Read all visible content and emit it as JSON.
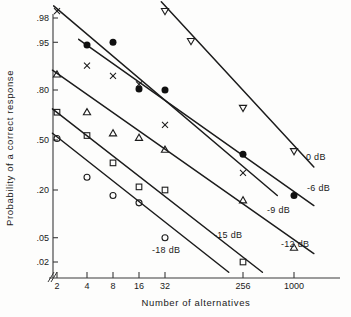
{
  "figure": {
    "kind": "scientific-plot",
    "background": "#fdfdfc",
    "ink": "#1c1c1c"
  },
  "chart_data": {
    "type": "scatter",
    "title": "",
    "subtitle": "",
    "xlabel": "Number of alternatives",
    "ylabel": "Probability of a correct response",
    "xscale": "log2",
    "yscale": "probit",
    "grid": false,
    "legend_position": "inline-right-of-each-line",
    "axis_break": "//",
    "xticks": [
      2,
      4,
      8,
      16,
      32,
      256,
      1000
    ],
    "xtick_labels": [
      "2",
      "4",
      "8",
      "16",
      "32",
      "256",
      "1000"
    ],
    "yticks": [
      0.98,
      0.95,
      0.8,
      0.5,
      0.2,
      0.05,
      0.02
    ],
    "ytick_labels": [
      ".98",
      ".95",
      ".80",
      ".50",
      ".20",
      ".05",
      ".02"
    ],
    "xlim": [
      1.7,
      2600
    ],
    "ylim": [
      0.012,
      0.99
    ],
    "series": [
      {
        "name": "0 dB",
        "label": "0 dB",
        "marker": "triangle-down",
        "filled": false,
        "points": [
          {
            "x": 32,
            "y": 0.985
          },
          {
            "x": 64,
            "y": 0.952
          },
          {
            "x": 256,
            "y": 0.705
          },
          {
            "x": 1000,
            "y": 0.425
          }
        ],
        "fit_from": {
          "x": 29,
          "y": 0.99
        },
        "fit_to": {
          "x": 1700,
          "y": 0.325
        }
      },
      {
        "name": "-6 dB",
        "label": "-6 dB",
        "marker": "circle",
        "filled": true,
        "points": [
          {
            "x": 4,
            "y": 0.945
          },
          {
            "x": 8,
            "y": 0.95
          },
          {
            "x": 16,
            "y": 0.805
          },
          {
            "x": 32,
            "y": 0.8
          },
          {
            "x": 256,
            "y": 0.405
          },
          {
            "x": 1000,
            "y": 0.175
          }
        ],
        "fit_from": {
          "x": 3.3,
          "y": 0.955
        },
        "fit_to": {
          "x": 1700,
          "y": 0.135
        }
      },
      {
        "name": "-9 dB",
        "label": "-9 dB",
        "marker": "x",
        "filled": false,
        "points": [
          {
            "x": 2,
            "y": 0.985
          },
          {
            "x": 4,
            "y": 0.895
          },
          {
            "x": 8,
            "y": 0.86
          },
          {
            "x": 16,
            "y": 0.825
          },
          {
            "x": 32,
            "y": 0.6
          },
          {
            "x": 256,
            "y": 0.29
          }
        ],
        "fit_from": {
          "x": 1.85,
          "y": 0.988
        },
        "fit_to": {
          "x": 640,
          "y": 0.175
        }
      },
      {
        "name": "-12 dB",
        "label": "-12 dB",
        "marker": "triangle-up",
        "filled": false,
        "points": [
          {
            "x": 2,
            "y": 0.865
          },
          {
            "x": 4,
            "y": 0.68
          },
          {
            "x": 8,
            "y": 0.545
          },
          {
            "x": 16,
            "y": 0.515
          },
          {
            "x": 32,
            "y": 0.435
          },
          {
            "x": 256,
            "y": 0.155
          },
          {
            "x": 1000,
            "y": 0.035
          }
        ],
        "fit_from": {
          "x": 1.8,
          "y": 0.88
        },
        "fit_to": {
          "x": 1700,
          "y": 0.028
        }
      },
      {
        "name": "-15 dB",
        "label": "-15 dB",
        "marker": "square",
        "filled": false,
        "points": [
          {
            "x": 2,
            "y": 0.68
          },
          {
            "x": 4,
            "y": 0.53
          },
          {
            "x": 8,
            "y": 0.35
          },
          {
            "x": 16,
            "y": 0.215
          },
          {
            "x": 32,
            "y": 0.2
          },
          {
            "x": 256,
            "y": 0.02
          }
        ],
        "fit_from": {
          "x": 1.8,
          "y": 0.7
        },
        "fit_to": {
          "x": 430,
          "y": 0.013
        }
      },
      {
        "name": "-18 dB",
        "label": "-18 dB",
        "marker": "circle",
        "filled": false,
        "points": [
          {
            "x": 2,
            "y": 0.51
          },
          {
            "x": 4,
            "y": 0.265
          },
          {
            "x": 8,
            "y": 0.175
          },
          {
            "x": 16,
            "y": 0.145
          },
          {
            "x": 32,
            "y": 0.05
          }
        ],
        "fit_from": {
          "x": 1.8,
          "y": 0.545
        },
        "fit_to": {
          "x": 175,
          "y": 0.013
        }
      }
    ],
    "series_label_positions": [
      {
        "name": "0 dB",
        "x": 306,
        "y": 160
      },
      {
        "name": "-6 dB",
        "x": 307,
        "y": 191
      },
      {
        "name": "-9 dB",
        "x": 267,
        "y": 213
      },
      {
        "name": "-12 dB",
        "x": 281,
        "y": 247
      },
      {
        "name": "-15 dB",
        "x": 214,
        "y": 238
      },
      {
        "name": "-18 dB",
        "x": 152,
        "y": 253
      }
    ]
  }
}
